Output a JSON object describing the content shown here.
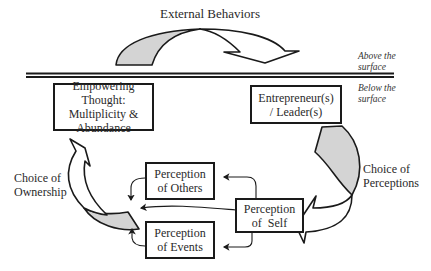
{
  "title": "External Behaviors",
  "surface_labels": {
    "above": [
      "Above the",
      "surface"
    ],
    "below": [
      "Below the",
      "surface"
    ]
  },
  "boxes": {
    "empowering": [
      "Empowering Thought:",
      "Multiplicity &",
      "Abundance"
    ],
    "entrepreneur": [
      "Entrepreneur(s)",
      "/ Leader(s)"
    ],
    "others": [
      "Perception",
      "of Others"
    ],
    "self": [
      "Perception",
      "of  Self"
    ],
    "events": [
      "Perception",
      "of Events"
    ]
  },
  "arrow_labels": {
    "ownership": [
      "Choice of",
      "Ownership"
    ],
    "perceptions": [
      "Choice of",
      "Perceptions"
    ]
  },
  "colors": {
    "arrow_fill": "#d4d4d4",
    "line": "#1a1a1a"
  }
}
